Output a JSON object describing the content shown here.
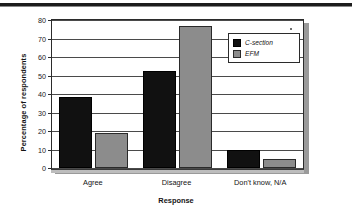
{
  "chart_data": {
    "type": "bar",
    "title": "",
    "subtitle": "",
    "xlabel": "Response",
    "ylabel": "Percentage of respondents",
    "categories": [
      "Agree",
      "Disagree",
      "Don't know, N/A"
    ],
    "series": [
      {
        "name": "C-section",
        "values": [
          38.5,
          52.5,
          9.5
        ],
        "color": "#111111"
      },
      {
        "name": "EFM",
        "values": [
          19,
          77,
          5
        ],
        "color": "#8c8c8c"
      }
    ],
    "ylim": [
      0,
      80
    ],
    "ytick_step": 10,
    "yticks": [
      0,
      10,
      20,
      30,
      40,
      50,
      60,
      70,
      80
    ],
    "ytick_labels": [
      "0",
      "10",
      "20",
      "30",
      "40",
      "50",
      "60",
      "70",
      "80"
    ],
    "grid": true,
    "grid_axis": "y",
    "legend_position": "top-right-inside"
  },
  "legend": {
    "entries": [
      {
        "label": "C-section",
        "color": "#111111"
      },
      {
        "label": "EFM",
        "color": "#8c8c8c"
      }
    ]
  },
  "axes": {
    "x_title": "Response",
    "y_title": "Percentage of respondents"
  }
}
